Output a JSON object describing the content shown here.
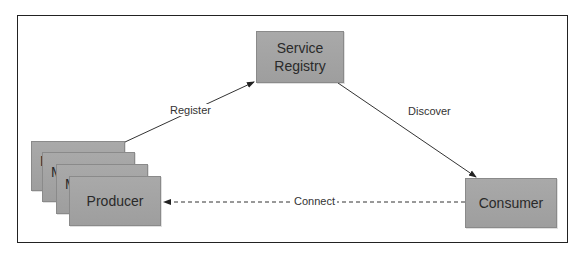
{
  "diagram": {
    "nodes": {
      "registry": {
        "label_line1": "Service",
        "label_line2": "Registry"
      },
      "consumer": {
        "label": "Consumer"
      },
      "producers": [
        {
          "label": "N"
        },
        {
          "label": "M"
        },
        {
          "label": "M"
        },
        {
          "label": "Producer"
        }
      ]
    },
    "edges": {
      "register": {
        "label": "Register",
        "from": "Producer",
        "to": "Service Registry",
        "style": "solid"
      },
      "discover": {
        "label": "Discover",
        "from": "Service Registry",
        "to": "Consumer",
        "style": "solid"
      },
      "connect": {
        "label": "Connect",
        "from": "Consumer",
        "to": "Producer",
        "style": "dashed"
      }
    },
    "colors": {
      "node_fill": "#a3a3a3",
      "node_border": "#8a8a8a",
      "edge": "#333333",
      "frame": "#222222"
    }
  }
}
